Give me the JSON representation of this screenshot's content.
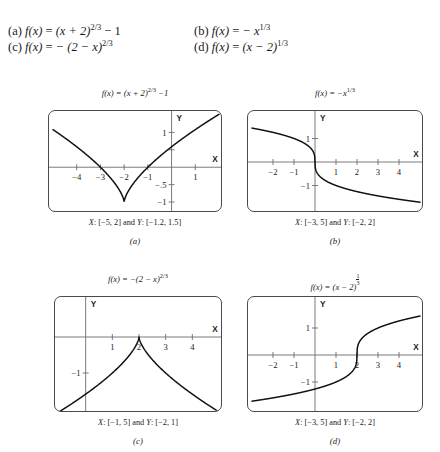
{
  "problems": {
    "items": [
      {
        "tag": "(a)",
        "func": "f(x)",
        "eq": "=",
        "body": "(x + 2)",
        "exponent": "2/3",
        "tail": "− 1"
      },
      {
        "tag": "(b)",
        "func": "f(x)",
        "eq": "=",
        "body": "− x",
        "exponent": "1/3",
        "tail": ""
      },
      {
        "tag": "(c)",
        "func": "f(x)",
        "eq": "=",
        "body": "− (2 − x)",
        "exponent": "2/3",
        "tail": ""
      },
      {
        "tag": "(d)",
        "func": "f(x)",
        "eq": "=",
        "body": "(x − 2)",
        "exponent": "1/3",
        "tail": ""
      }
    ]
  },
  "panels": [
    {
      "letter": "(a)",
      "title_prefix": "f(x) = (x + 2)",
      "title_exponent": "2/3",
      "title_suffix": "−1",
      "caption": "X: [−5, 2] and Y: [−1.2, 1.5]",
      "caption_xvar": "X",
      "caption_yvar": "Y",
      "caption_xrange": ": [−5, 2] and ",
      "caption_yrange": ": [−1.2, 1.5]",
      "axis_x_label": "X",
      "axis_y_label": "Y",
      "xticks": [
        {
          "value": -4,
          "label": "−4"
        },
        {
          "value": -3,
          "label": "−3"
        },
        {
          "value": -2,
          "label": "−2"
        },
        {
          "value": -1,
          "label": "−1"
        },
        {
          "value": 1,
          "label": "1"
        }
      ],
      "yticks": [
        {
          "value": 1,
          "label": "1"
        },
        {
          "value": 0.5,
          "label": ""
        },
        {
          "value": -0.5,
          "label": "−.5"
        },
        {
          "value": -1,
          "label": "−1"
        }
      ]
    },
    {
      "letter": "(b)",
      "title_prefix": "f(x) = −x",
      "title_exponent": "1/3",
      "title_suffix": "",
      "caption": "X: [−3, 5] and Y: [−2, 2]",
      "caption_xvar": "X",
      "caption_yvar": "Y",
      "caption_xrange": ": [−3, 5] and ",
      "caption_yrange": ": [−2, 2]",
      "axis_x_label": "X",
      "axis_y_label": "Y",
      "xticks": [
        {
          "value": -2,
          "label": "−2"
        },
        {
          "value": -1,
          "label": "−1"
        },
        {
          "value": 1,
          "label": "1"
        },
        {
          "value": 2,
          "label": "2"
        },
        {
          "value": 3,
          "label": "3"
        },
        {
          "value": 4,
          "label": "4"
        }
      ],
      "yticks": [
        {
          "value": 1,
          "label": "1"
        },
        {
          "value": -1,
          "label": "−1"
        }
      ]
    },
    {
      "letter": "(c)",
      "title_prefix": "f(x) = −(2 − x)",
      "title_exponent": "2/3",
      "title_suffix": "",
      "caption": "X: [−1, 5] and Y: [−2, 1]",
      "caption_xvar": "X",
      "caption_yvar": "Y",
      "caption_xrange": ": [−1, 5] and ",
      "caption_yrange": ": [−2, 1]",
      "axis_x_label": "X",
      "axis_y_label": "Y",
      "xticks": [
        {
          "value": 1,
          "label": "1"
        },
        {
          "value": 2,
          "label": "2"
        },
        {
          "value": 3,
          "label": "3"
        },
        {
          "value": 4,
          "label": "4"
        }
      ],
      "yticks": [
        {
          "value": -1,
          "label": "−1"
        }
      ]
    },
    {
      "letter": "(d)",
      "title_prefix": "f(x) = (x − 2)",
      "title_exponent_num": "1",
      "title_exponent_den": "3",
      "title_suffix": "",
      "caption": "X: [−3, 5] and Y: [−2, 2]",
      "caption_xvar": "X",
      "caption_yvar": "Y",
      "caption_xrange": ": [−3, 5] and ",
      "caption_yrange": ": [−2, 2]",
      "axis_x_label": "X",
      "axis_y_label": "Y",
      "xticks": [
        {
          "value": -2,
          "label": "−2"
        },
        {
          "value": -1,
          "label": "−1"
        },
        {
          "value": 1,
          "label": "1"
        },
        {
          "value": 2,
          "label": "2"
        },
        {
          "value": 3,
          "label": "3"
        },
        {
          "value": 4,
          "label": "4"
        }
      ],
      "yticks": [
        {
          "value": 1,
          "label": "1"
        },
        {
          "value": -1,
          "label": "−1"
        }
      ]
    }
  ],
  "chart_data": [
    {
      "panel": "(a)",
      "type": "line",
      "title": "f(x) = (x + 2)^(2/3) − 1",
      "expression": "(x + 2)^(2/3) - 1",
      "xlabel": "X",
      "ylabel": "Y",
      "xlim": [
        -5,
        2
      ],
      "ylim": [
        -1.2,
        1.5
      ],
      "xticks": [
        -4,
        -3,
        -2,
        -1,
        1
      ],
      "yticks": [
        -1,
        -0.5,
        0.5,
        1
      ],
      "grid": false,
      "legend": "none",
      "x": [
        -5,
        -4.5,
        -4,
        -3.5,
        -3,
        -2.5,
        -2.2,
        -2,
        -1.8,
        -1.5,
        -1,
        -0.5,
        0,
        0.5,
        1,
        1.5,
        2
      ],
      "y": [
        1.08,
        0.842,
        0.587,
        0.31,
        0,
        -0.37,
        -0.643,
        -1,
        -0.658,
        -0.38,
        0,
        0.31,
        0.587,
        0.842,
        1.08,
        1.305,
        1.52
      ]
    },
    {
      "panel": "(b)",
      "type": "line",
      "title": "f(x) = −x^(1/3)",
      "expression": "-x^(1/3)",
      "xlabel": "X",
      "ylabel": "Y",
      "xlim": [
        -3,
        5
      ],
      "ylim": [
        -2,
        2
      ],
      "xticks": [
        -2,
        -1,
        1,
        2,
        3,
        4
      ],
      "yticks": [
        -1,
        1
      ],
      "grid": false,
      "legend": "none",
      "x": [
        -3,
        -2.5,
        -2,
        -1.5,
        -1,
        -0.5,
        -0.1,
        0,
        0.1,
        0.5,
        1,
        1.5,
        2,
        3,
        4,
        5
      ],
      "y": [
        1.442,
        1.357,
        1.26,
        1.145,
        1,
        0.794,
        0.464,
        0,
        -0.464,
        -0.794,
        -1,
        -1.145,
        -1.26,
        -1.442,
        -1.587,
        -1.71
      ]
    },
    {
      "panel": "(c)",
      "type": "line",
      "title": "f(x) = −(2 − x)^(2/3)",
      "expression": "-(2 - x)^(2/3)",
      "xlabel": "X",
      "ylabel": "Y",
      "xlim": [
        -1,
        5
      ],
      "ylim": [
        -2,
        1
      ],
      "xticks": [
        1,
        2,
        3,
        4
      ],
      "yticks": [
        -1
      ],
      "grid": false,
      "legend": "none",
      "x": [
        -1,
        -0.5,
        0,
        0.5,
        1,
        1.5,
        1.8,
        2,
        2.2,
        2.5,
        3,
        3.5,
        4,
        4.5,
        5
      ],
      "y": [
        -2.08,
        -1.842,
        -1.587,
        -1.31,
        -1,
        -0.63,
        -0.342,
        0,
        -0.342,
        -0.63,
        -1,
        -1.31,
        -1.587,
        -1.842,
        -2.08
      ]
    },
    {
      "panel": "(d)",
      "type": "line",
      "title": "f(x) = (x − 2)^(1/3)",
      "expression": "(x - 2)^(1/3)",
      "xlabel": "X",
      "ylabel": "Y",
      "xlim": [
        -3,
        5
      ],
      "ylim": [
        -2,
        2
      ],
      "xticks": [
        -2,
        -1,
        1,
        2,
        3,
        4
      ],
      "yticks": [
        -1,
        1
      ],
      "grid": false,
      "legend": "none",
      "x": [
        -3,
        -2,
        -1,
        0,
        1,
        1.5,
        1.9,
        2,
        2.1,
        2.5,
        3,
        4,
        5
      ],
      "y": [
        -1.71,
        -1.587,
        -1.442,
        -1.26,
        -1,
        -0.794,
        -0.464,
        0,
        0.464,
        0.794,
        1,
        1.26,
        1.442
      ]
    }
  ],
  "colors": {
    "curve": "#111111",
    "axis": "#6b6b6b",
    "box_border": "#4a4a4a",
    "text": "#1a1a1a",
    "background": "#ffffff"
  }
}
